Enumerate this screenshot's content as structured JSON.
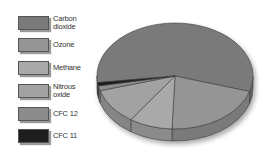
{
  "chart_data": {
    "type": "pie",
    "title": "",
    "style": "3d-pie",
    "legend_position": "left",
    "categories": [
      "Carbon dioxide",
      "Ozone",
      "Methane",
      "Nitrous oxide",
      "CFC 12",
      "CFC 11"
    ],
    "values": [
      57,
      21,
      9,
      11,
      1.5,
      1
    ],
    "unit": "approx. % share (estimated from slice angles)",
    "colors": [
      "#7a7a7a",
      "#959595",
      "#a9a9a9",
      "#a2a2a2",
      "#8c8c8c",
      "#1e1e1e"
    ]
  },
  "legend": {
    "items": [
      {
        "label": "Carbon\ndioxide",
        "color": "#7a7a7a"
      },
      {
        "label": "Ozone",
        "color": "#959595"
      },
      {
        "label": "Methane",
        "color": "#a9a9a9"
      },
      {
        "label": "Nitrous\noxide",
        "color": "#a2a2a2"
      },
      {
        "label": "CFC 12",
        "color": "#8c8c8c"
      },
      {
        "label": "CFC 11",
        "color": "#1e1e1e"
      }
    ]
  }
}
